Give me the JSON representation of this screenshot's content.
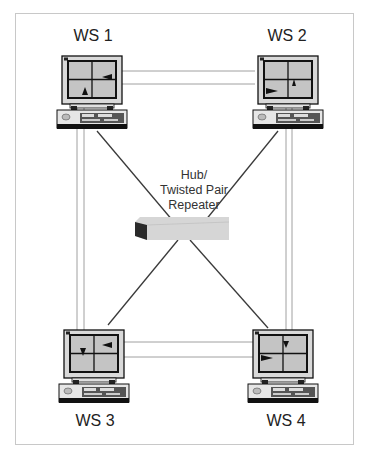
{
  "diagram": {
    "workstations": [
      {
        "id": "ws1",
        "label": "WS 1"
      },
      {
        "id": "ws2",
        "label": "WS 2"
      },
      {
        "id": "ws3",
        "label": "WS 3"
      },
      {
        "id": "ws4",
        "label": "WS 4"
      }
    ],
    "hub": {
      "lines": [
        "Hub/",
        "Twisted Pair",
        "Repeater"
      ]
    },
    "colors": {
      "frame": "#c8c8c8",
      "link_dark": "#3a3a3a",
      "link_light": "#a0a0a0",
      "monitor_body": "#d9d9d9",
      "screen": "#c4c4c4",
      "hub_top": "#d6d6d6",
      "hub_side": "#2a2a2a"
    }
  }
}
